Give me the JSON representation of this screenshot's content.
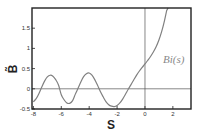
{
  "chart_data": {
    "type": "line",
    "title": "",
    "xlabel": "S",
    "ylabel": "B̃",
    "xlim": [
      -8.1,
      3.3
    ],
    "ylim": [
      -0.5,
      2.0
    ],
    "grid": false,
    "legend": null,
    "x_ticks": [
      -8,
      -6,
      -4,
      -2,
      0,
      2
    ],
    "x_tick_labels": [
      "-8",
      "-6",
      "-4",
      "-2",
      "0",
      "2"
    ],
    "y_ticks": [
      -0.5,
      0,
      0.5,
      1,
      1.5
    ],
    "y_tick_labels": [
      "-0.5",
      "0",
      "0.5",
      "1",
      "1.5"
    ],
    "reference_lines": [
      {
        "orientation": "horizontal",
        "value": 0
      },
      {
        "orientation": "vertical",
        "value": 0
      }
    ],
    "annotations": [
      {
        "text": "Bi(s)",
        "x": 1.3,
        "y": 0.65
      }
    ],
    "series": [
      {
        "name": "Bi(s)",
        "color": "#808080",
        "x": [
          -8.0,
          -7.8,
          -7.6,
          -7.4,
          -7.2,
          -7.0,
          -6.8,
          -6.6,
          -6.4,
          -6.2,
          -6.0,
          -5.8,
          -5.6,
          -5.4,
          -5.2,
          -5.0,
          -4.8,
          -4.6,
          -4.4,
          -4.2,
          -4.0,
          -3.8,
          -3.6,
          -3.4,
          -3.2,
          -3.0,
          -2.8,
          -2.6,
          -2.4,
          -2.2,
          -2.0,
          -1.8,
          -1.6,
          -1.4,
          -1.2,
          -1.0,
          -0.8,
          -0.6,
          -0.4,
          -0.2,
          0.0,
          0.2,
          0.4,
          0.6,
          0.8,
          1.0,
          1.2,
          1.4,
          1.55
        ],
        "values": [
          -0.323,
          -0.245,
          -0.114,
          0.045,
          0.189,
          0.293,
          0.336,
          0.312,
          0.227,
          0.095,
          -0.146,
          -0.271,
          -0.35,
          -0.36,
          -0.3,
          -0.138,
          0.012,
          0.171,
          0.3,
          0.375,
          0.392,
          0.338,
          0.228,
          0.085,
          -0.069,
          -0.198,
          -0.315,
          -0.393,
          -0.43,
          -0.44,
          -0.412,
          -0.349,
          -0.254,
          -0.135,
          -0.01,
          0.104,
          0.224,
          0.34,
          0.44,
          0.53,
          0.615,
          0.706,
          0.8,
          0.91,
          1.04,
          1.207,
          1.42,
          1.69,
          1.93
        ]
      }
    ]
  }
}
